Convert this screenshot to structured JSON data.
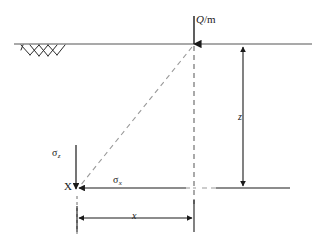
{
  "figure": {
    "background_color": "#ffffff",
    "width": 327,
    "height": 246
  },
  "labels": {
    "load": {
      "symbol": "Q",
      "separator": "/",
      "unit": "m",
      "full_text": "Q/m",
      "description": "line load per unit length applied at ground surface"
    },
    "depth_dimension": {
      "symbol": "z",
      "description": "vertical depth from ground surface to point X"
    },
    "horizontal_dimension": {
      "symbol": "x",
      "description": "horizontal offset from load to point X"
    },
    "stress_vertical": {
      "symbol": "σ",
      "subscript": "z",
      "description": "vertical stress component at point X"
    },
    "stress_horizontal": {
      "symbol": "σ",
      "subscript": "x",
      "description": "horizontal stress component at point X"
    },
    "point": {
      "symbol": "X",
      "description": "point in the soil mass where stresses are evaluated"
    }
  },
  "geometry": {
    "ground_line": {
      "x1": 14,
      "y1": 44,
      "x2": 312,
      "y2": 44
    },
    "load_point": {
      "x": 194,
      "y": 44
    },
    "load_arrow": {
      "x1": 194,
      "y1": 17,
      "x2": 194,
      "y2": 45
    },
    "stress_point": {
      "x": 76,
      "y": 188
    },
    "vertical_dashed": {
      "x1": 194,
      "y1": 45,
      "x2": 194,
      "y2": 205
    },
    "diagonal_dashed": {
      "x1": 193,
      "y1": 46,
      "x2": 79,
      "y2": 187
    },
    "horizontal_dashed": {
      "x1": 194,
      "y1": 188,
      "x2": 80,
      "y2": 188
    },
    "z_dimension_line": {
      "x": 243,
      "y1": 45,
      "y2": 188
    },
    "x_dimension_line": {
      "y": 218,
      "x1": 77,
      "x2": 193
    },
    "sigma_z_arrow": {
      "x": 76,
      "y1": 145,
      "y2": 188
    },
    "sigma_x_arrow": {
      "y": 188,
      "x1": 186,
      "x2": 80
    },
    "hatch_region": {
      "x1": 20,
      "x2": 66,
      "y": 44
    }
  },
  "colors": {
    "line_dark": "#1a1a1a",
    "line_gray": "#8a8a8a",
    "dash_gray": "#9a9a9a",
    "ground_line": "#8c8c8c",
    "text": "#1a1a1a",
    "background": "#ffffff"
  }
}
